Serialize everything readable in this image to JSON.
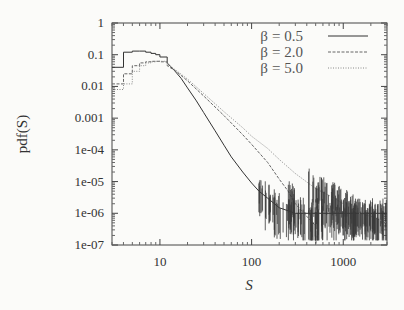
{
  "chart_data": {
    "type": "line",
    "title": "",
    "xlabel": "S",
    "ylabel": "pdf(S)",
    "xscale": "log",
    "yscale": "log",
    "xlim": [
      3,
      3000
    ],
    "ylim": [
      1e-07,
      1
    ],
    "xticks": [
      10,
      100,
      1000
    ],
    "xtick_labels": [
      "10",
      "100",
      "1000"
    ],
    "yticks": [
      1,
      0.1,
      0.01,
      0.001,
      0.0001,
      1e-05,
      1e-06,
      1e-07
    ],
    "ytick_labels": [
      "1",
      "0.1",
      "0.01",
      "0.001",
      "1e-04",
      "1e-05",
      "1e-06",
      "1e-07"
    ],
    "grid": false,
    "legend_position": "top-right",
    "series": [
      {
        "name": "β = 0.5",
        "legend_label_prefix": "β",
        "legend_label_value": "= 0.5",
        "style": "solid",
        "color": "#333333",
        "x": [
          3,
          4,
          5,
          6,
          7,
          8,
          9,
          10,
          12,
          14,
          17,
          20,
          25,
          30,
          40,
          50,
          60,
          80,
          100,
          120,
          150,
          200,
          300,
          500,
          1000,
          2000,
          3000
        ],
        "y": [
          0.04,
          0.12,
          0.13,
          0.13,
          0.12,
          0.11,
          0.1,
          0.085,
          0.055,
          0.035,
          0.018,
          0.009,
          0.0035,
          0.0015,
          0.0004,
          0.00014,
          6e-05,
          2e-05,
          9e-06,
          5e-06,
          3e-06,
          1.5e-06,
          1e-06,
          1e-06,
          1e-06,
          1e-06,
          1e-06
        ]
      },
      {
        "name": "β = 2.0",
        "legend_label_prefix": "β",
        "legend_label_value": "= 2.0",
        "style": "dashed",
        "color": "#666666",
        "x": [
          3,
          4,
          5,
          6,
          7,
          8,
          9,
          10,
          12,
          15,
          20,
          30,
          50,
          80,
          100,
          150,
          200,
          250,
          300,
          400,
          500
        ],
        "y": [
          0.012,
          0.025,
          0.045,
          0.055,
          0.06,
          0.062,
          0.062,
          0.06,
          0.045,
          0.03,
          0.015,
          0.005,
          0.0012,
          0.0003,
          0.00015,
          4e-05,
          1.2e-05,
          5e-06,
          2e-06,
          8e-07,
          4e-07
        ]
      },
      {
        "name": "β = 5.0",
        "legend_label_prefix": "β",
        "legend_label_value": "= 5.0",
        "style": "dotted",
        "color": "#888888",
        "x": [
          3,
          4,
          5,
          6,
          7,
          8,
          9,
          10,
          12,
          15,
          20,
          30,
          50,
          80,
          100,
          150,
          200,
          300,
          500,
          800,
          1000,
          1500,
          2000,
          3000
        ],
        "y": [
          0.008,
          0.012,
          0.03,
          0.045,
          0.055,
          0.06,
          0.062,
          0.062,
          0.05,
          0.032,
          0.017,
          0.006,
          0.0016,
          0.0005,
          0.00027,
          0.00011,
          5e-05,
          1.8e-05,
          6e-06,
          3e-06,
          2e-06,
          1e-06,
          8e-07,
          5e-07
        ]
      }
    ]
  }
}
